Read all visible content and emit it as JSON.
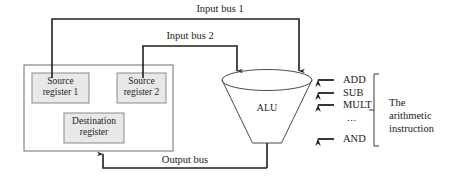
{
  "diagram": {
    "colors": {
      "line": "#231f20",
      "register_fill": "#e8e8e8",
      "register_stroke": "#8a8a8a",
      "file_stroke": "#6f6f6f",
      "alu_stroke": "#4a4a4a",
      "text": "#1a1a1a",
      "background": "#ffffff"
    },
    "buses": [
      {
        "id": "input-bus-1",
        "label": "Input bus 1"
      },
      {
        "id": "input-bus-2",
        "label": "Input bus 2"
      },
      {
        "id": "output-bus",
        "label": "Output bus"
      }
    ],
    "register_file": {
      "registers": [
        {
          "id": "source-register-1",
          "line1": "Source",
          "line2": "register 1"
        },
        {
          "id": "source-register-2",
          "line1": "Source",
          "line2": "register 2"
        },
        {
          "id": "destination-register",
          "line1": "Destination",
          "line2": "register"
        }
      ]
    },
    "alu": {
      "label": "ALU"
    },
    "instructions": {
      "items": [
        {
          "id": "add",
          "label": "ADD",
          "arrow": true
        },
        {
          "id": "sub",
          "label": "SUB",
          "arrow": true
        },
        {
          "id": "mult",
          "label": "MULT",
          "arrow": true
        },
        {
          "id": "ellipsis",
          "label": "...",
          "arrow": false
        },
        {
          "id": "and",
          "label": "AND",
          "arrow": true
        }
      ],
      "bracket_label_line1": "The",
      "bracket_label_line2": "arithmetic",
      "bracket_label_line3": "instruction"
    }
  }
}
